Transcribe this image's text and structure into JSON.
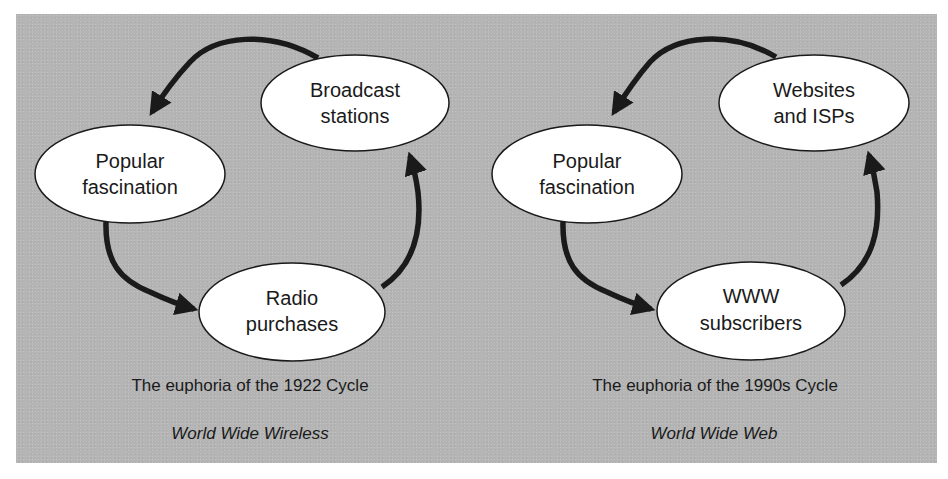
{
  "colors": {
    "panel_background": "#b5b5b5",
    "node_fill": "#ffffff",
    "node_stroke": "#1a1a1a",
    "arrow": "#1a1a1a",
    "text": "#1a1a1a"
  },
  "diagrams": [
    {
      "caption": "The euphoria of the 1922 Cycle",
      "subtitle": "World Wide Wireless",
      "nodes": [
        {
          "line1": "Broadcast",
          "line2": "stations"
        },
        {
          "line1": "Popular",
          "line2": "fascination"
        },
        {
          "line1": "Radio",
          "line2": "purchases"
        }
      ],
      "edges": [
        {
          "from": "Broadcast stations",
          "to": "Popular fascination"
        },
        {
          "from": "Popular fascination",
          "to": "Radio purchases"
        },
        {
          "from": "Radio purchases",
          "to": "Broadcast stations"
        }
      ]
    },
    {
      "caption": "The euphoria of the 1990s Cycle",
      "subtitle": "World Wide Web",
      "nodes": [
        {
          "line1": "Websites",
          "line2": "and ISPs"
        },
        {
          "line1": "Popular",
          "line2": "fascination"
        },
        {
          "line1": "WWW",
          "line2": "subscribers"
        }
      ],
      "edges": [
        {
          "from": "Websites and ISPs",
          "to": "Popular fascination"
        },
        {
          "from": "Popular fascination",
          "to": "WWW subscribers"
        },
        {
          "from": "WWW subscribers",
          "to": "Websites and ISPs"
        }
      ]
    }
  ]
}
